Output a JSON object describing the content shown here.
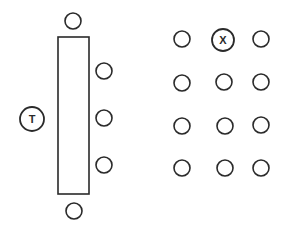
{
  "diagram": {
    "title": "",
    "stroke_color": "#2a2a2a",
    "background": "#ffffff",
    "table": {
      "x": 58,
      "y": 37,
      "width": 31,
      "height": 157
    },
    "head_seat": {
      "cx": 32,
      "cy": 119,
      "r": 12,
      "label": "T"
    },
    "table_seats": [
      {
        "cx": 73,
        "cy": 21,
        "r": 8
      },
      {
        "cx": 104,
        "cy": 71,
        "r": 8
      },
      {
        "cx": 104,
        "cy": 118,
        "r": 8
      },
      {
        "cx": 104,
        "cy": 165,
        "r": 8
      },
      {
        "cx": 74,
        "cy": 211,
        "r": 8
      }
    ],
    "grid_seats": [
      {
        "cx": 182,
        "cy": 39,
        "r": 8,
        "label": ""
      },
      {
        "cx": 223,
        "cy": 40,
        "r": 11,
        "label": "X"
      },
      {
        "cx": 261,
        "cy": 39,
        "r": 8,
        "label": ""
      },
      {
        "cx": 182,
        "cy": 83,
        "r": 8,
        "label": ""
      },
      {
        "cx": 224,
        "cy": 82,
        "r": 8,
        "label": ""
      },
      {
        "cx": 261,
        "cy": 82,
        "r": 8,
        "label": ""
      },
      {
        "cx": 182,
        "cy": 126,
        "r": 8,
        "label": ""
      },
      {
        "cx": 225,
        "cy": 126,
        "r": 8,
        "label": ""
      },
      {
        "cx": 261,
        "cy": 125,
        "r": 8,
        "label": ""
      },
      {
        "cx": 182,
        "cy": 168,
        "r": 8,
        "label": ""
      },
      {
        "cx": 225,
        "cy": 168,
        "r": 8,
        "label": ""
      },
      {
        "cx": 261,
        "cy": 168,
        "r": 8,
        "label": ""
      }
    ]
  }
}
